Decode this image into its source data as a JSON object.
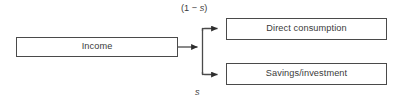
{
  "diagram": {
    "type": "flow-diagram",
    "background_color": "#ffffff",
    "line_color": "#4a4a4a",
    "text_color": "#3a3a3a",
    "nodes": [
      {
        "id": "income",
        "label": "Income",
        "shape": "rectangle",
        "x": 16,
        "y": 37,
        "width": 162,
        "height": 20
      },
      {
        "id": "direct_consumption",
        "label": "Direct consumption",
        "shape": "rectangle",
        "x": 226,
        "y": 18,
        "width": 161,
        "height": 22
      },
      {
        "id": "savings_investment",
        "label": "Savings/investment",
        "shape": "rectangle",
        "x": 226,
        "y": 63,
        "width": 161,
        "height": 22
      }
    ],
    "edges": [
      {
        "id": "income-to-split",
        "from": "income",
        "to": "split-junction",
        "arrowhead": "filled-triangle"
      },
      {
        "id": "split-to-direct-consumption",
        "from": "split-junction",
        "to": "direct_consumption",
        "arrowhead": "filled-triangle",
        "label": "(1 − s)",
        "label_prefix": "(1 − ",
        "label_variable": "s",
        "label_suffix": ")",
        "label_position": "above"
      },
      {
        "id": "split-to-savings-investment",
        "from": "split-junction",
        "to": "savings_investment",
        "arrowhead": "filled-triangle",
        "label": "s",
        "label_variable": "s",
        "label_position": "below"
      }
    ]
  }
}
